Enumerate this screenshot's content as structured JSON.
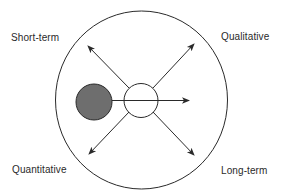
{
  "diagram": {
    "labels": {
      "top_left": "Short-term",
      "top_right": "Qualitative",
      "bottom_left": "Quantitative",
      "bottom_right": "Long-term"
    },
    "colors": {
      "stroke": "#2a2a2a",
      "filled_circle": "#6e6e6e",
      "hollow_circle": "#ffffff",
      "background": "#ffffff"
    },
    "elements": {
      "outer_circle": "boundary-circle",
      "filled_circle": "filled-gray-circle",
      "center_circle": "hollow-center-circle",
      "arrows": [
        "arrow-up-left",
        "arrow-up-right",
        "arrow-right",
        "arrow-down-left",
        "arrow-down-right"
      ]
    }
  }
}
